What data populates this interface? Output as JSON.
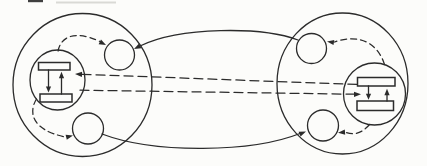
{
  "canvas": {
    "width": 427,
    "height": 166,
    "viewbox": "0 0 427 166"
  },
  "palette": {
    "ink": "#2b2b2b",
    "paper": "#fcfcfa",
    "artifact_dark": "#3f3f3f",
    "artifact_light": "#d9d9d5"
  },
  "diagram": {
    "type": "network-figure",
    "shapes": [
      {
        "name": "scan-artifact-dark",
        "type": "rect",
        "x": 28,
        "y": 0,
        "w": 15,
        "h": 2.2,
        "fill": "#3f3f3f",
        "stroke": "none"
      },
      {
        "name": "scan-artifact-light",
        "type": "rect",
        "x": 56,
        "y": 1.5,
        "w": 60,
        "h": 2,
        "fill": "#d9d9d5",
        "stroke": "none"
      },
      {
        "name": "left-host-circle",
        "type": "ellipse",
        "cx": 82.5,
        "cy": 85,
        "rx": 69.5,
        "ry": 71.5,
        "stroke": "ink",
        "sw": 1.3
      },
      {
        "name": "right-host-circle",
        "type": "ellipse",
        "cx": 342.5,
        "cy": 83.5,
        "rx": 65.5,
        "ry": 70.5,
        "stroke": "ink",
        "sw": 1.3
      },
      {
        "name": "left-top-process-circle",
        "type": "circle",
        "cx": 119.5,
        "cy": 55,
        "r": 15,
        "stroke": "ink",
        "sw": 1.3
      },
      {
        "name": "left-bottom-process-circle",
        "type": "circle",
        "cx": 88,
        "cy": 128.5,
        "r": 15.5,
        "stroke": "ink",
        "sw": 1.3
      },
      {
        "name": "right-top-process-circle",
        "type": "circle",
        "cx": 311.5,
        "cy": 48.5,
        "r": 15,
        "stroke": "ink",
        "sw": 1.3
      },
      {
        "name": "right-bottom-process-circle",
        "type": "circle",
        "cx": 323,
        "cy": 125.5,
        "r": 15.5,
        "stroke": "ink",
        "sw": 1.3
      },
      {
        "name": "intercluster-top-arc",
        "type": "path",
        "d": "M 298 40 C 262 26.5, 180 26.5, 140 46",
        "stroke": "ink",
        "sw": 1.3
      },
      {
        "name": "intercluster-bottom-arc",
        "type": "path",
        "d": "M 102 134 C 155 154, 252 152.5, 300 133.5",
        "stroke": "ink",
        "sw": 1.3
      },
      {
        "name": "left-top-dashed-arc",
        "type": "path",
        "d": "M 58 51 C 61 37, 74 29.5, 100 41.5",
        "stroke": "ink",
        "sw": 1.25,
        "dash": "6 4"
      },
      {
        "name": "left-bottom-dashed-arc",
        "type": "path",
        "d": "M 36.5 99 C 28.5 112, 31 130, 65.5 137",
        "stroke": "ink",
        "sw": 1.25,
        "dash": "6 4"
      },
      {
        "name": "right-top-dashed-arc",
        "type": "path",
        "d": "M 384.5 64.5 C 378.5 45, 361 32.5, 334.5 42",
        "stroke": "ink",
        "sw": 1.25,
        "dash": "6 4"
      },
      {
        "name": "right-bottom-dashed-arc",
        "type": "path",
        "d": "M 369.5 124.5 C 362 133.5, 353.5 135.5, 345.5 132.3",
        "stroke": "ink",
        "sw": 1.25,
        "dash": "6 4"
      },
      {
        "name": "channel-dash-top",
        "type": "path",
        "d": "M 82 74.3 L 357.5 84.5",
        "stroke": "ink",
        "sw": 1.25,
        "dash": "9 5"
      },
      {
        "name": "channel-dash-bottom",
        "type": "path",
        "d": "M 80 90.2 L 353.8 94.2",
        "stroke": "ink",
        "sw": 1.25,
        "dash": "9 5"
      },
      {
        "name": "left-kernel-circle",
        "type": "ellipse",
        "cx": 57.5,
        "cy": 80,
        "rx": 27.5,
        "ry": 30,
        "stroke": "ink",
        "sw": 1.3
      },
      {
        "name": "right-kernel-circle",
        "type": "circle",
        "cx": 374.5,
        "cy": 94,
        "r": 31,
        "stroke": "ink",
        "sw": 1.3
      },
      {
        "name": "left-kernel-top-bar",
        "type": "rect",
        "x": 38.5,
        "y": 62.5,
        "w": 31.5,
        "h": 7.5,
        "fill": "paper",
        "stroke": "ink",
        "sw": 1.5
      },
      {
        "name": "left-kernel-bottom-bar",
        "type": "rect",
        "x": 40,
        "y": 94,
        "w": 32,
        "h": 8,
        "fill": "paper",
        "stroke": "ink",
        "sw": 1.5
      },
      {
        "name": "right-kernel-top-bar",
        "type": "rect",
        "x": 357.5,
        "y": 77.5,
        "w": 37.5,
        "h": 8.5,
        "fill": "paper",
        "stroke": "ink",
        "sw": 1.5
      },
      {
        "name": "right-kernel-bottom-bar",
        "type": "rect",
        "x": 357,
        "y": 101,
        "w": 36.5,
        "h": 9.5,
        "fill": "paper",
        "stroke": "ink",
        "sw": 1.5
      },
      {
        "name": "left-kernel-down-line",
        "type": "path",
        "d": "M 48.5 70 L 48.5 87.5",
        "stroke": "ink",
        "sw": 1.3
      },
      {
        "name": "left-kernel-up-line",
        "type": "path",
        "d": "M 61.5 94 L 61.5 77.8",
        "stroke": "ink",
        "sw": 1.3
      },
      {
        "name": "right-kernel-down-line",
        "type": "path",
        "d": "M 368.5 86 L 368.5 94.3",
        "stroke": "ink",
        "sw": 1.3
      },
      {
        "name": "right-kernel-up-line",
        "type": "path",
        "d": "M 387 101 L 387 94.8",
        "stroke": "ink",
        "sw": 1.3
      },
      {
        "name": "arrowhead-top-arc-to-left-top-process",
        "type": "polygon",
        "points": "134,49 139,43.6 141.4,48.2",
        "fill": "ink",
        "stroke": "none"
      },
      {
        "name": "arrowhead-left-kernel-to-top-process",
        "type": "polygon",
        "points": "106,45 98.6,44.2 101,39.6",
        "fill": "ink",
        "stroke": "none"
      },
      {
        "name": "arrowhead-channel-to-left-kernel",
        "type": "polygon",
        "points": "75,74.1 82.1,71.8 81.9,77",
        "fill": "ink",
        "stroke": "none"
      },
      {
        "name": "arrowhead-left-kernel-down",
        "type": "polygon",
        "points": "48.5,92.5 45.9,86.5 51.1,86.5",
        "fill": "ink",
        "stroke": "none"
      },
      {
        "name": "arrowhead-left-kernel-up",
        "type": "polygon",
        "points": "61.5,71.8 58.9,78.3 64.1,78.3",
        "fill": "ink",
        "stroke": "none"
      },
      {
        "name": "arrowhead-left-kernel-to-bottom-process",
        "type": "polygon",
        "points": "73,135.5 66.8,139.7 65.6,134.7",
        "fill": "ink",
        "stroke": "none"
      },
      {
        "name": "arrowhead-bottom-arc-to-right-bottom-process",
        "type": "polygon",
        "points": "306,131.5 300.6,136.6 298.6,131.8",
        "fill": "ink",
        "stroke": "none"
      },
      {
        "name": "arrowhead-right-kernel-to-bottom-process",
        "type": "polygon",
        "points": "338,132.8 344.8,129.6 345.2,134.8",
        "fill": "ink",
        "stroke": "none"
      },
      {
        "name": "arrowhead-right-kernel-to-top-process",
        "type": "polygon",
        "points": "327,41.5 334.3,40 333.5,45.1",
        "fill": "ink",
        "stroke": "none"
      },
      {
        "name": "arrowhead-channel-to-right-kernel",
        "type": "polygon",
        "points": "361,94.3 354,91.7 354,96.9",
        "fill": "ink",
        "stroke": "none"
      },
      {
        "name": "arrowhead-right-kernel-down",
        "type": "polygon",
        "points": "368.5,99.8 365.9,93.8 371.1,93.8",
        "fill": "ink",
        "stroke": "none"
      },
      {
        "name": "arrowhead-right-kernel-up",
        "type": "polygon",
        "points": "387,88.8 384.4,95.3 389.6,95.3",
        "fill": "ink",
        "stroke": "none"
      }
    ]
  }
}
